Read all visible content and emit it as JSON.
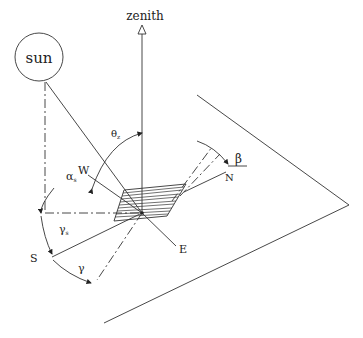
{
  "diagram": {
    "labels": {
      "sun": "sun",
      "zenith": "zenith",
      "theta_z": "θ",
      "theta_z_sub": "z",
      "alpha_s": "α",
      "alpha_s_sub": "s",
      "gamma_s": "γ",
      "gamma_s_sub": "s",
      "gamma": "γ",
      "beta": "β",
      "north": "N",
      "south": "S",
      "east": "E",
      "west": "W"
    },
    "colors": {
      "line": "#333333",
      "text": "#222222",
      "background": "#ffffff"
    }
  }
}
